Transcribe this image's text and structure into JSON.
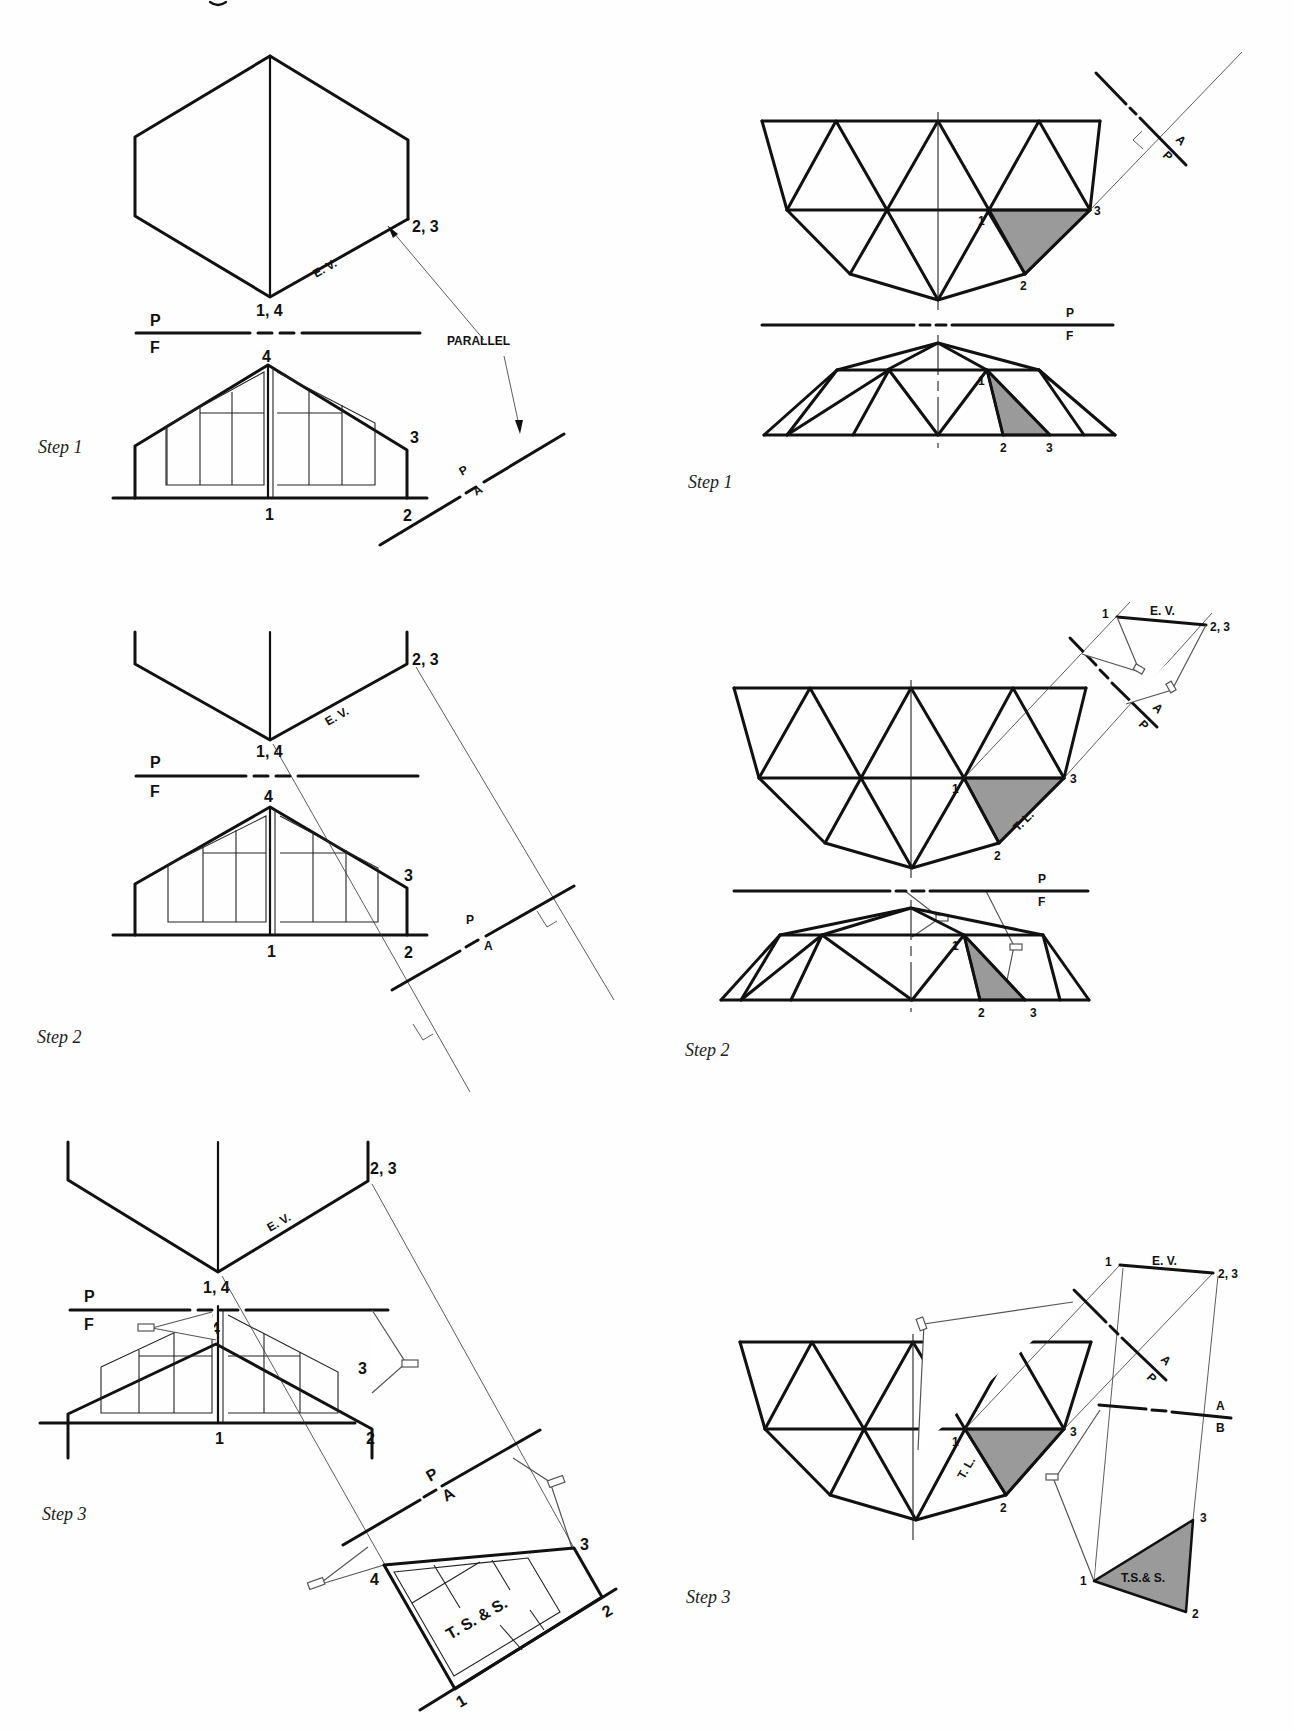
{
  "page": {
    "header_fragment": "...",
    "background": "#fefefe",
    "ink_color": "#111111",
    "shade_color": "#9a9a9a"
  },
  "panels": [
    {
      "id": "house-step-1",
      "column": "left",
      "step_label": "Step 1",
      "fold_line_top": "P",
      "fold_line_bottom": "F",
      "aux_fold_top": "P",
      "aux_fold_bottom": "A",
      "point_labels": [
        "2, 3",
        "1, 4",
        "4",
        "3",
        "1",
        "2"
      ],
      "edge_view_label": "E. V.",
      "annotation": "PARALLEL"
    },
    {
      "id": "dome-step-1",
      "column": "right",
      "step_label": "Step 1",
      "fold_line_top": "P",
      "fold_line_bottom": "F",
      "aux_fold_top": "P",
      "aux_fold_bottom": "A",
      "point_labels_top": [
        "1",
        "3",
        "2"
      ],
      "point_labels_front": [
        "1",
        "2",
        "3"
      ]
    },
    {
      "id": "house-step-2",
      "column": "left",
      "step_label": "Step 2",
      "fold_line_top": "P",
      "fold_line_bottom": "F",
      "aux_fold_top": "P",
      "aux_fold_bottom": "A",
      "point_labels": [
        "2, 3",
        "1, 4",
        "4",
        "3",
        "1",
        "2"
      ],
      "edge_view_label": "E. V."
    },
    {
      "id": "dome-step-2",
      "column": "right",
      "step_label": "Step 2",
      "fold_line_top": "P",
      "fold_line_bottom": "F",
      "aux_fold_top": "P",
      "aux_fold_bottom": "A",
      "point_labels_top": [
        "1",
        "3",
        "2"
      ],
      "point_labels_front": [
        "1",
        "2",
        "3"
      ],
      "aux_point_labels": [
        "1",
        "2, 3"
      ],
      "edge_view_label": "E. V.",
      "true_length_label": "T. L."
    },
    {
      "id": "house-step-3",
      "column": "left",
      "step_label": "Step 3",
      "fold_line_top": "P",
      "fold_line_bottom": "F",
      "aux_fold_top": "P",
      "aux_fold_bottom": "A",
      "point_labels": [
        "2, 3",
        "1, 4",
        "4",
        "3",
        "1",
        "2"
      ],
      "edge_view_label": "E. V.",
      "true_shape_points": [
        "4",
        "3",
        "2",
        "1"
      ],
      "true_shape_label": "T. S. & S."
    },
    {
      "id": "dome-step-3",
      "column": "right",
      "step_label": "Step 3",
      "aux_fold_top": "P",
      "aux_fold_bottom": "A",
      "second_aux_fold_top": "A",
      "second_aux_fold_bottom": "B",
      "point_labels_top": [
        "1",
        "3",
        "2"
      ],
      "aux_point_labels": [
        "1",
        "2, 3"
      ],
      "edge_view_label": "E. V.",
      "true_length_label": "T. L.",
      "true_shape_points": [
        "1",
        "3",
        "2"
      ],
      "true_shape_label": "T.S.& S."
    }
  ]
}
